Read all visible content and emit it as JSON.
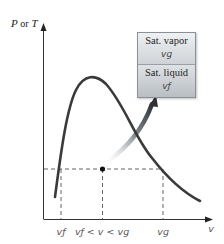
{
  "axes": {
    "y_label_main": "P",
    "y_label_or": "or",
    "y_label_alt": "T",
    "x_label": "v"
  },
  "x_ticks": [
    {
      "id": "vf",
      "label": "v_f",
      "display": "vƒ"
    },
    {
      "id": "mix",
      "label": "v_f < v < v_g",
      "display": "vƒ < v < vɡ"
    },
    {
      "id": "vg",
      "label": "v_g",
      "display": "vɡ"
    }
  ],
  "inset_box": {
    "top_title": "Sat. vapor",
    "top_symbol": "vɡ",
    "bottom_title": "Sat. liquid",
    "bottom_symbol": "vƒ"
  },
  "colors": {
    "curve": "#3a3a3a",
    "axis": "#333333",
    "dashed": "#555555",
    "arrow_dark": "#2f3136",
    "arrow_light": "#d7dadd"
  },
  "annotations": {
    "point": "state point in saturated mixture region",
    "arrow": "points to inset table of saturated vapor and liquid specific volumes"
  }
}
